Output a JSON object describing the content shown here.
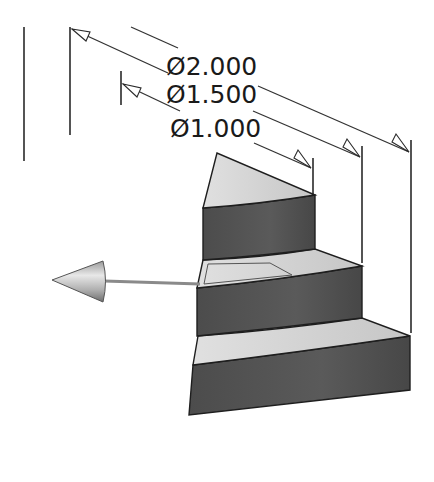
{
  "diagram": {
    "type": "cad-stepped-cylinder-sector",
    "colors": {
      "background": "#ffffff",
      "top_face": "#d4d4d4",
      "side_face": "#555555",
      "line": "#2a2a2a",
      "arrow_shaft": "#8a8a8a"
    },
    "dimensions": [
      {
        "label": "Ø2.000",
        "value": 2.0
      },
      {
        "label": "Ø1.500",
        "value": 1.5
      },
      {
        "label": "Ø1.000",
        "value": 1.0
      }
    ],
    "tiers": [
      {
        "name": "top-tier",
        "diameter": "Ø1.000"
      },
      {
        "name": "middle-tier",
        "diameter": "Ø1.500"
      },
      {
        "name": "bottom-tier",
        "diameter": "Ø2.000"
      }
    ],
    "direction_arrow": {
      "name": "cone-direction-arrow",
      "points": "left"
    }
  }
}
